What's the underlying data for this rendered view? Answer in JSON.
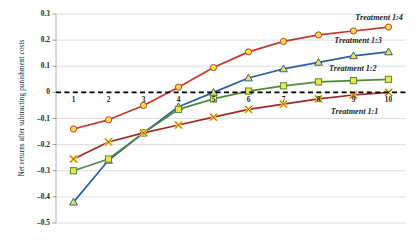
{
  "chart_data": {
    "type": "line",
    "title": "",
    "xlabel": "Period",
    "ylabel": "Net returns after subtracting punishment costs",
    "x": [
      1,
      2,
      3,
      4,
      5,
      6,
      7,
      8,
      9,
      10
    ],
    "xticklabels": [
      "1",
      "2",
      "3",
      "4",
      "5",
      "6",
      "7",
      "8",
      "9",
      "10"
    ],
    "yticklabels": [
      "0.3",
      "0.2",
      "0.1",
      "0",
      "-0.1",
      "-0.2",
      "-0.3",
      "-0.4",
      "-0.5"
    ],
    "ytickvalues": [
      0.3,
      0.2,
      0.1,
      0,
      -0.1,
      -0.2,
      -0.3,
      -0.4,
      -0.5
    ],
    "ylim": [
      -0.5,
      0.3
    ],
    "xlim": [
      0.5,
      10.5
    ],
    "grid": true,
    "grid_axis": "y",
    "legend": "inline-right-of-series",
    "zero_line": true,
    "zero_line_style": "dashed",
    "zero_line_color": "#000000",
    "series": [
      {
        "name": "Treatment 1:4",
        "color": "#c0392b",
        "marker": "circle",
        "marker_fill": "#f2e34c",
        "values": [
          -0.14,
          -0.105,
          -0.05,
          0.02,
          0.095,
          0.155,
          0.195,
          0.22,
          0.235,
          0.25
        ],
        "label_x": 9.05,
        "label_y": 0.285
      },
      {
        "name": "Treatment 1:3",
        "color": "#2e5f9e",
        "marker": "triangle",
        "marker_fill": "#f2e34c",
        "values": [
          -0.42,
          -0.26,
          -0.155,
          -0.055,
          0.0,
          0.055,
          0.09,
          0.115,
          0.14,
          0.155
        ],
        "label_x": 8.45,
        "label_y": 0.195
      },
      {
        "name": "Treatment 1:2",
        "color": "#4e8a3c",
        "marker": "square",
        "marker_fill": "#f2e34c",
        "values": [
          -0.3,
          -0.255,
          -0.155,
          -0.065,
          -0.025,
          0.005,
          0.025,
          0.04,
          0.045,
          0.05
        ],
        "label_x": 8.3,
        "label_y": 0.09
      },
      {
        "name": "Treatment 1:1",
        "color": "#9e2b25",
        "marker": "x",
        "marker_fill": "#f2e34c",
        "values": [
          -0.255,
          -0.19,
          -0.155,
          -0.125,
          -0.095,
          -0.065,
          -0.045,
          -0.025,
          -0.01,
          0.0
        ],
        "label_x": 8.35,
        "label_y": -0.075
      }
    ]
  }
}
